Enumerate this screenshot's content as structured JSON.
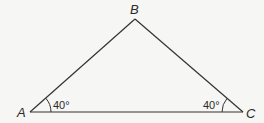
{
  "diagram": {
    "type": "triangle",
    "vertices": {
      "A": {
        "label": "A",
        "x": 30,
        "y": 112
      },
      "B": {
        "label": "B",
        "x": 135,
        "y": 19
      },
      "C": {
        "label": "C",
        "x": 243,
        "y": 112
      }
    },
    "angles": {
      "A": {
        "label": "40°"
      },
      "C": {
        "label": "40°"
      }
    },
    "colors": {
      "stroke": "#333333",
      "background": "#f6f6f4"
    }
  }
}
